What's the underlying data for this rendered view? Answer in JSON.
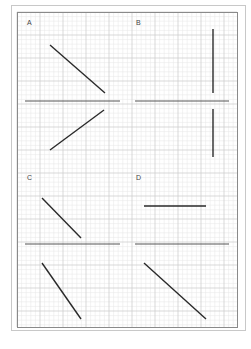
{
  "figure": {
    "panels": [
      {
        "label": "A",
        "label_pos": [
          28,
          22
        ]
      },
      {
        "label": "B",
        "label_pos": [
          137,
          22
        ]
      },
      {
        "label": "C",
        "label_pos": [
          28,
          177
        ]
      },
      {
        "label": "D",
        "label_pos": [
          137,
          177
        ]
      }
    ],
    "colors": {
      "outer_border": "#c8c8c8",
      "frame_border": "#8a8a8a",
      "grid_minor": "#e6e6e6",
      "grid_major": "#cfcfcf",
      "axis_line": "#555555",
      "segment": "#2a2a2a"
    },
    "grid": {
      "x0": 17,
      "y0": 12,
      "x1": 237,
      "y1": 327,
      "minor_step": 4.6,
      "major_every": 5
    },
    "axes": [
      {
        "name": "A-axis",
        "x1": 25,
        "y1": 101,
        "x2": 120,
        "y2": 101
      },
      {
        "name": "B-axis",
        "x1": 135,
        "y1": 101,
        "x2": 229,
        "y2": 101
      },
      {
        "name": "C-axis",
        "x1": 25,
        "y1": 244,
        "x2": 120,
        "y2": 244
      },
      {
        "name": "D-axis",
        "x1": 135,
        "y1": 244,
        "x2": 229,
        "y2": 244
      }
    ],
    "segments": [
      {
        "panel": "A",
        "part": "upper",
        "x1": 50,
        "y1": 45,
        "x2": 105,
        "y2": 93
      },
      {
        "panel": "A",
        "part": "lower",
        "x1": 50,
        "y1": 150,
        "x2": 104,
        "y2": 110
      },
      {
        "panel": "B",
        "part": "upper",
        "x1": 213,
        "y1": 29,
        "x2": 213,
        "y2": 93
      },
      {
        "panel": "B",
        "part": "lower",
        "x1": 213,
        "y1": 109,
        "x2": 213,
        "y2": 157
      },
      {
        "panel": "C",
        "part": "upper",
        "x1": 42,
        "y1": 198,
        "x2": 81,
        "y2": 238
      },
      {
        "panel": "C",
        "part": "lower",
        "x1": 42,
        "y1": 263,
        "x2": 81,
        "y2": 319
      },
      {
        "panel": "D",
        "part": "upper",
        "x1": 144,
        "y1": 206,
        "x2": 206,
        "y2": 206
      },
      {
        "panel": "D",
        "part": "lower",
        "x1": 144,
        "y1": 263,
        "x2": 206,
        "y2": 319
      }
    ]
  }
}
